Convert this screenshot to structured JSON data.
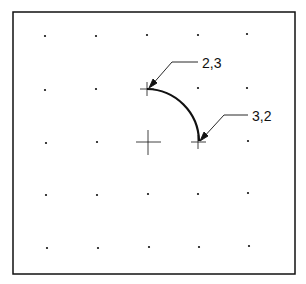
{
  "diagram": {
    "frame": {
      "x": 13,
      "y": 12,
      "width": 282,
      "height": 262
    },
    "grid": {
      "cols_x": [
        45,
        96,
        147,
        198,
        248
      ],
      "rows_y": [
        35,
        89,
        142,
        194,
        247
      ]
    },
    "arc": {
      "start": {
        "label": "2,3",
        "x": 147,
        "y": 89
      },
      "end": {
        "label": "3,2",
        "x": 198,
        "y": 142
      },
      "center": {
        "x": 147,
        "y": 142
      }
    },
    "callouts": [
      {
        "label": "2,3",
        "text_x": 202,
        "text_y": 55
      },
      {
        "label": "3,2",
        "text_x": 252,
        "text_y": 108
      }
    ],
    "colors": {
      "line": "#111111",
      "background": "#ffffff"
    }
  }
}
